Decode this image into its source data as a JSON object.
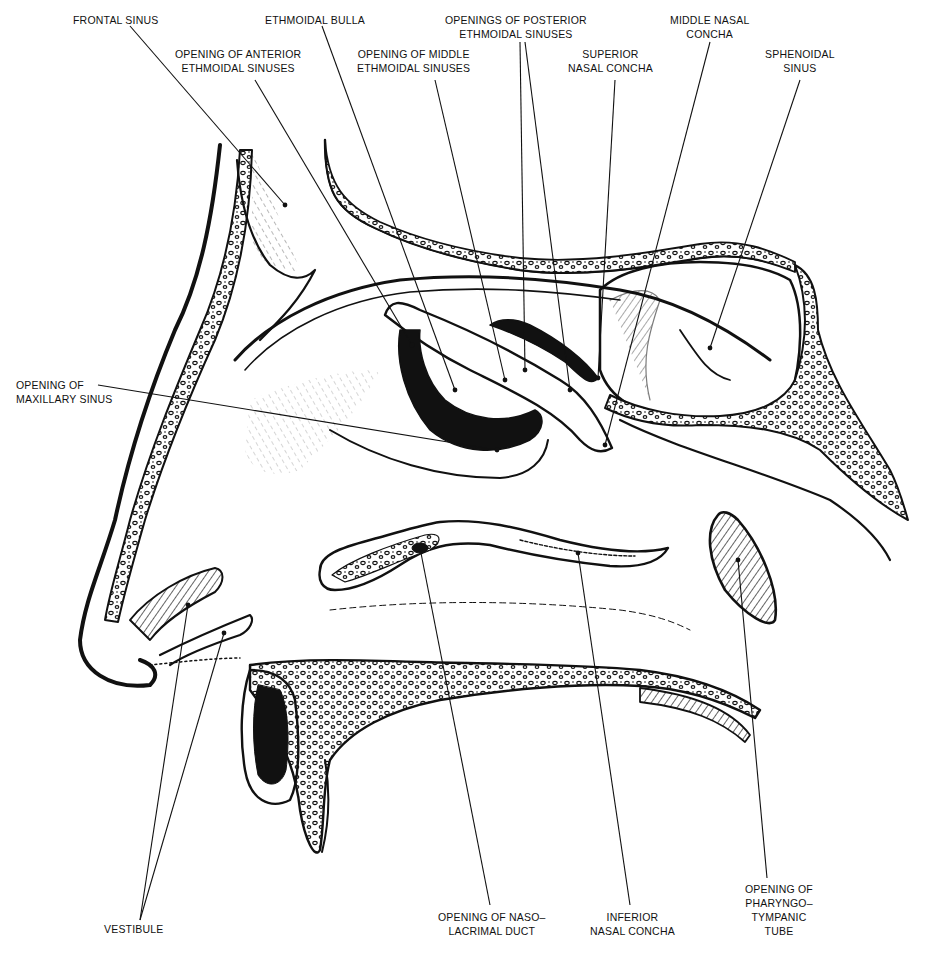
{
  "figure": {
    "colors": {
      "ink": "#111111",
      "paper": "#ffffff"
    }
  },
  "labels": {
    "frontal_sinus": {
      "lines": [
        "FRONTAL SINUS"
      ]
    },
    "ethmoidal_bulla": {
      "lines": [
        "ETHMOIDAL BULLA"
      ]
    },
    "posterior_ethmoidal": {
      "lines": [
        "OPENINGS OF POSTERIOR",
        "ETHMOIDAL SINUSES"
      ]
    },
    "middle_nasal_concha": {
      "lines": [
        "MIDDLE NASAL",
        "CONCHA"
      ]
    },
    "anterior_ethmoidal": {
      "lines": [
        "OPENING OF ANTERIOR",
        "ETHMOIDAL SINUSES"
      ]
    },
    "middle_ethmoidal": {
      "lines": [
        "OPENING OF MIDDLE",
        "ETHMOIDAL SINUSES"
      ]
    },
    "superior_nasal_concha": {
      "lines": [
        "SUPERIOR",
        "NASAL CONCHA"
      ]
    },
    "sphenoidal_sinus": {
      "lines": [
        "SPHENOIDAL",
        "SINUS"
      ]
    },
    "maxillary_sinus": {
      "lines": [
        "OPENING OF",
        "MAXILLARY SINUS"
      ]
    },
    "vestibule": {
      "lines": [
        "VESTIBULE"
      ]
    },
    "nasolacrimal_duct": {
      "lines": [
        "OPENING OF NASO–",
        "LACRIMAL DUCT"
      ]
    },
    "inferior_nasal_concha": {
      "lines": [
        "INFERIOR",
        "NASAL CONCHA"
      ]
    },
    "pharyngotympanic_tube": {
      "lines": [
        "OPENING OF",
        "PHARYNGO–",
        "TYMPANIC",
        "TUBE"
      ]
    }
  }
}
